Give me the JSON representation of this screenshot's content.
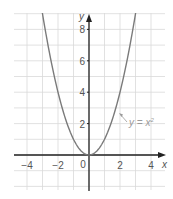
{
  "chart_data": {
    "type": "line",
    "title": "",
    "xlabel": "x",
    "ylabel": "y",
    "xlim": [
      -5,
      5
    ],
    "ylim": [
      -2,
      9
    ],
    "grid": true,
    "x_ticks": [
      -4,
      -2,
      0,
      2,
      4
    ],
    "x_tick_labels": [
      "−4",
      "−2",
      "0",
      "2",
      "4"
    ],
    "y_ticks": [
      2,
      4,
      6,
      8
    ],
    "y_tick_labels": [
      "2",
      "4",
      "6",
      "8"
    ],
    "series": [
      {
        "name": "y = x²",
        "x": [
          -3,
          -2.5,
          -2,
          -1.5,
          -1,
          -0.5,
          0,
          0.5,
          1,
          1.5,
          2,
          2.5,
          3
        ],
        "y": [
          9,
          6.25,
          4,
          2.25,
          1,
          0.25,
          0,
          0.25,
          1,
          2.25,
          4,
          6.25,
          9
        ],
        "color": "#7a7a7a"
      }
    ],
    "annotations": [
      {
        "text_prefix": "y = x",
        "superscript": "2",
        "x": 1.9,
        "y": 3.3,
        "arrow_to": [
          1.7,
          2.9
        ]
      }
    ],
    "colors": {
      "grid": "#d9d9d9",
      "axis": "#222222",
      "curve": "#7a7a7a",
      "label": "#555555",
      "annotation": "#9a9a9a"
    }
  },
  "labels": {
    "x_axis": "x",
    "y_axis": "y",
    "origin": "0",
    "curve_label": "y = x",
    "curve_exp": "2"
  }
}
